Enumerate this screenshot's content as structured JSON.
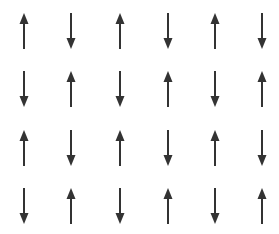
{
  "diagram": {
    "type": "spin-lattice",
    "rows": 4,
    "cols": 6,
    "arrow_color": "#333333",
    "background": "#ffffff",
    "column_centers_x": [
      24,
      71,
      120,
      168,
      215,
      262
    ],
    "row_tops_y": [
      13,
      71,
      130,
      188
    ],
    "spins": [
      [
        "up",
        "down",
        "up",
        "down",
        "up",
        "down"
      ],
      [
        "down",
        "up",
        "down",
        "up",
        "down",
        "up"
      ],
      [
        "up",
        "down",
        "up",
        "down",
        "up",
        "down"
      ],
      [
        "down",
        "up",
        "down",
        "up",
        "down",
        "up"
      ]
    ]
  }
}
